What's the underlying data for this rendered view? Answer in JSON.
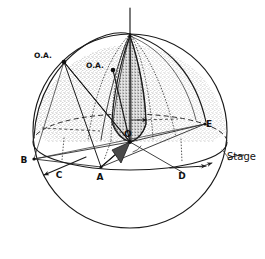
{
  "figure": {
    "background_color": "#ffffff",
    "ink_color": "#1a1a1a"
  },
  "labels": {
    "optic_axis_left": "O.A.",
    "optic_axis_right": "O.A.",
    "origin": "O",
    "point_a": "A",
    "point_b": "B",
    "point_c": "C",
    "point_d": "D",
    "point_e": "E",
    "stage": "Stage"
  },
  "geometry": {
    "sphere": {
      "center_x": 130,
      "center_y": 131,
      "radius": 97
    },
    "stage_ellipse": {
      "center_x": 130,
      "center_y": 142,
      "rx": 97,
      "ry": 28
    },
    "vertical_axis": {
      "top_y": 8,
      "bottom_y": 142,
      "x": 130
    },
    "points": {
      "origin": [
        130,
        142
      ],
      "pole_top": [
        130,
        36
      ],
      "optic_axis_left": [
        64,
        62
      ],
      "optic_axis_right": [
        113,
        70
      ],
      "a": [
        101,
        167
      ],
      "b": [
        34,
        159
      ],
      "c": [
        60,
        171
      ],
      "d": [
        182,
        172
      ],
      "e": [
        205,
        124
      ]
    }
  },
  "shading": {
    "upper_hemisphere_fill": "#d8d8d8",
    "lune_fill": "#a8a8a8",
    "triangle_fill": "#555555",
    "stipple_opacity": 0.55
  },
  "annotations": {
    "stage_leader_from": [
      228,
      160
    ],
    "stage_leader_to": [
      244,
      156
    ],
    "arrow_c_direction": "down-left",
    "arrow_d_direction": "right"
  }
}
